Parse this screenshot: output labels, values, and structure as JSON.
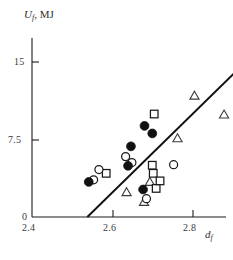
{
  "chart_data": {
    "type": "scatter",
    "title": "",
    "xlabel": "d_f",
    "ylabel": "U_f, MJ",
    "xlabel_base": "d",
    "xlabel_sub": "f",
    "ylabel_base": "U",
    "ylabel_sub": "f",
    "ylabel_units": ", MJ",
    "xlim": [
      2.4,
      2.8
    ],
    "ylim": [
      0,
      16.6
    ],
    "xticks": [
      2.4,
      2.6,
      2.8
    ],
    "xticklabels": [
      "2.4",
      "2.6",
      "2.8"
    ],
    "yticks": [
      0,
      7.5,
      15
    ],
    "yticklabels": [
      "0",
      "7.5",
      "15"
    ],
    "grid": false,
    "legend": "none",
    "series": [
      {
        "name": "filled-circle",
        "marker": "filled circle",
        "points": [
          [
            2.517,
            3.25
          ],
          [
            2.598,
            4.75
          ],
          [
            2.604,
            6.55
          ],
          [
            2.632,
            8.45
          ],
          [
            2.648,
            7.75
          ],
          [
            2.629,
            2.55
          ]
        ]
      },
      {
        "name": "open-circle",
        "marker": "open circle",
        "points": [
          [
            2.527,
            3.45
          ],
          [
            2.538,
            4.4
          ],
          [
            2.593,
            5.6
          ],
          [
            2.606,
            5.05
          ],
          [
            2.692,
            4.85
          ],
          [
            2.636,
            1.7
          ]
        ]
      },
      {
        "name": "open-square",
        "marker": "open square",
        "points": [
          [
            2.553,
            4.05
          ],
          [
            2.652,
            9.55
          ],
          [
            2.648,
            4.8
          ],
          [
            2.65,
            4.05
          ],
          [
            2.656,
            2.65
          ],
          [
            2.664,
            3.35
          ]
        ]
      },
      {
        "name": "open-triangle",
        "marker": "open triangle",
        "points": [
          [
            2.595,
            2.35
          ],
          [
            2.643,
            3.3
          ],
          [
            2.631,
            1.45
          ],
          [
            2.735,
            11.3
          ],
          [
            2.796,
            9.55
          ],
          [
            2.7,
            7.35
          ]
        ]
      }
    ],
    "trend_line": {
      "name": "fit-line",
      "x0": 2.514,
      "y0": 0.0,
      "x1": 2.832,
      "y1": 14.0
    },
    "annotations": []
  },
  "axis": {
    "y_title_base": "U",
    "y_title_sub": "f",
    "y_title_units": ", MJ",
    "x_title_base": "d",
    "x_title_sub": "f",
    "ytick_15": "15",
    "ytick_75": "7.5",
    "ytick_0": "0",
    "xtick_24": "2.4",
    "xtick_26": "2.6",
    "xtick_28": "2.8"
  }
}
